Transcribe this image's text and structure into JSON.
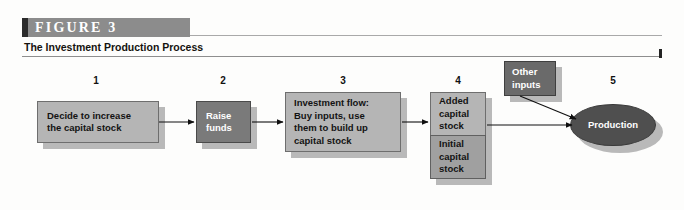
{
  "figure": {
    "tag_label": "FIGURE 3",
    "subtitle": "The Investment Production Process",
    "accent_bar_color": "#8c8c8c",
    "accent_edge_color": "#2b2b2b"
  },
  "diagram": {
    "step_numbers": [
      "1",
      "2",
      "3",
      "4",
      "5"
    ],
    "nodes": [
      {
        "id": "decide",
        "step": "1",
        "label": "Decide to increase\nthe capital stock",
        "fill": "#b5b5b5",
        "text_color": "#131313",
        "shape": "box"
      },
      {
        "id": "raise",
        "step": "2",
        "label": "Raise\nfunds",
        "fill": "#7a7a7a",
        "text_color": "#ffffff",
        "shape": "box"
      },
      {
        "id": "investment",
        "step": "3",
        "label": "Investment flow:\nBuy inputs, use\nthem to build up\ncapital stock",
        "fill": "#b5b5b5",
        "text_color": "#131313",
        "shape": "box"
      },
      {
        "id": "added-capital",
        "step": "4",
        "label": "Added\ncapital\nstock",
        "fill": "#b5b5b5",
        "text_color": "#131313",
        "shape": "box"
      },
      {
        "id": "initial-capital",
        "step": "4",
        "label": "Initial\ncapital\nstock",
        "fill": "#a0a0a0",
        "text_color": "#131313",
        "shape": "box"
      },
      {
        "id": "other-inputs",
        "step": "",
        "label": "Other\ninputs",
        "fill": "#6a6a6a",
        "text_color": "#ffffff",
        "shape": "box"
      },
      {
        "id": "production",
        "step": "5",
        "label": "Production",
        "fill": "#4f4f4f",
        "text_color": "#ffffff",
        "shape": "ellipse"
      }
    ],
    "arrows": [
      {
        "from": "decide",
        "to": "raise"
      },
      {
        "from": "raise",
        "to": "investment"
      },
      {
        "from": "investment",
        "to": "added-capital"
      },
      {
        "from": "added-capital",
        "to": "production"
      },
      {
        "from": "other-inputs",
        "to": "production"
      }
    ]
  }
}
